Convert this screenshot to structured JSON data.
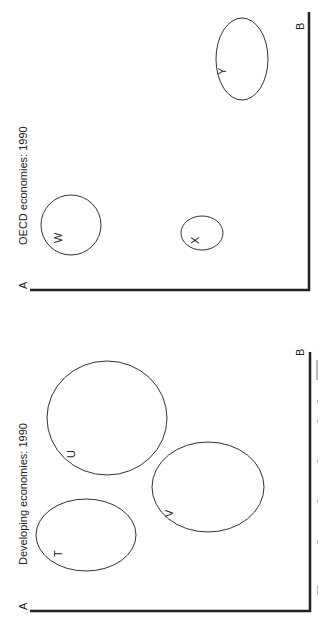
{
  "panels": [
    {
      "title": "OECD economies: 1990",
      "axis_a": "A",
      "axis_b": "B",
      "bubbles": [
        {
          "label": "W",
          "cx": 71,
          "cy": 225,
          "rx": 30,
          "ry": 30
        },
        {
          "label": "X",
          "cx": 202,
          "cy": 233,
          "rx": 21,
          "ry": 17
        },
        {
          "label": "Y",
          "cx": 242,
          "cy": 59,
          "rx": 26,
          "ry": 41
        }
      ]
    },
    {
      "title": "Developing economies: 1990",
      "axis_a": "A",
      "axis_b": "B",
      "bubbles": [
        {
          "label": "T",
          "cx": 86,
          "cy": 535,
          "rx": 50,
          "ry": 36
        },
        {
          "label": "U",
          "cx": 107,
          "cy": 418,
          "rx": 60,
          "ry": 57
        },
        {
          "label": "V",
          "cx": 208,
          "cy": 487,
          "rx": 56,
          "ry": 45
        }
      ]
    }
  ],
  "colors": {
    "line": "#222222",
    "background": "#ffffff"
  }
}
